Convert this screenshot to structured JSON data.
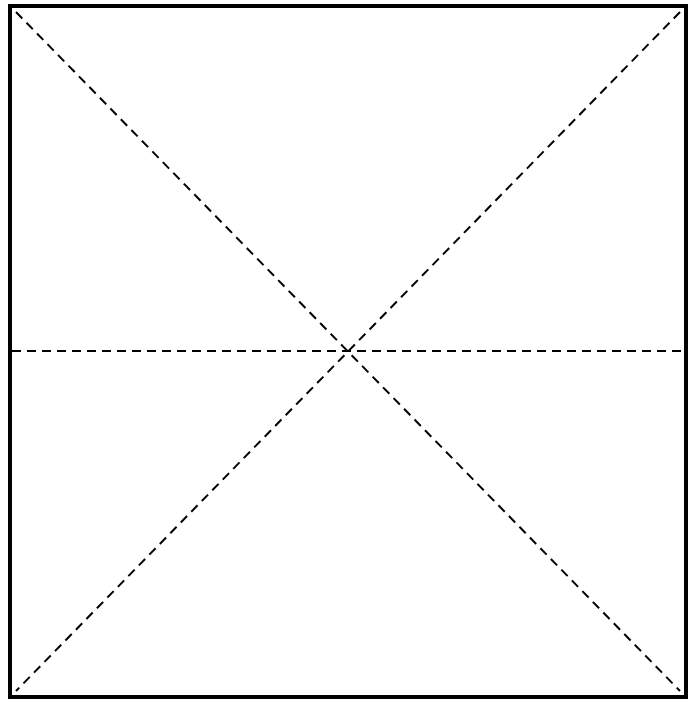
{
  "diagram": {
    "colors": {
      "border": "#000000",
      "lines": "#000000",
      "background": "#ffffff"
    },
    "box": {
      "x1": 10,
      "y1": 6,
      "x2": 686,
      "y2": 697,
      "stroke_width": 4
    },
    "lines": [
      {
        "name": "diagonal-top-left-to-bottom-right",
        "x1": 16,
        "y1": 12,
        "x2": 680,
        "y2": 691,
        "style": "dashed"
      },
      {
        "name": "diagonal-top-right-to-bottom-left",
        "x1": 680,
        "y1": 12,
        "x2": 16,
        "y2": 691,
        "style": "dashed"
      },
      {
        "name": "horizontal-midline",
        "x1": 12,
        "y1": 351,
        "x2": 684,
        "y2": 351,
        "style": "dashed"
      }
    ],
    "intersection": {
      "x": 344,
      "y": 351
    }
  }
}
